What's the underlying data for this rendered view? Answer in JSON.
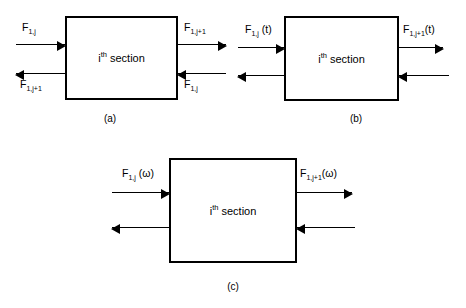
{
  "figure": {
    "type": "block-diagram",
    "panels": [
      {
        "id": "a",
        "caption": "(a)",
        "block_label_base": "i",
        "block_label_sup": "th",
        "block_label_rest": "section",
        "arrows": [
          {
            "id": "a-top-left",
            "direction": "right",
            "label_base": "F",
            "label_sub": "1,j",
            "label_suffix": ""
          },
          {
            "id": "a-top-right",
            "direction": "right",
            "label_base": "F",
            "label_sub": "1,j+1",
            "label_suffix": ""
          },
          {
            "id": "a-bottom-left",
            "direction": "left",
            "label_base": "F",
            "label_sub": "1,j+1",
            "label_suffix": ""
          },
          {
            "id": "a-bottom-right",
            "direction": "left",
            "label_base": "F",
            "label_sub": "1,j",
            "label_suffix": ""
          }
        ]
      },
      {
        "id": "b",
        "caption": "(b)",
        "block_label_base": "i",
        "block_label_sup": "th",
        "block_label_rest": "section",
        "arrows": [
          {
            "id": "b-top-left",
            "direction": "right",
            "label_base": "F",
            "label_sub": "1,j",
            "label_suffix": " (t)"
          },
          {
            "id": "b-top-right",
            "direction": "right",
            "label_base": "F",
            "label_sub": "1,j+1",
            "label_suffix": "(t)"
          },
          {
            "id": "b-bottom-left",
            "direction": "left",
            "label_base": "",
            "label_sub": "",
            "label_suffix": ""
          },
          {
            "id": "b-bottom-right",
            "direction": "left",
            "label_base": "",
            "label_sub": "",
            "label_suffix": ""
          }
        ]
      },
      {
        "id": "c",
        "caption": "(c)",
        "block_label_base": "i",
        "block_label_sup": "th",
        "block_label_rest": "section",
        "arrows": [
          {
            "id": "c-top-left",
            "direction": "right",
            "label_base": "F",
            "label_sub": "1,j",
            "label_suffix": " (ω)"
          },
          {
            "id": "c-top-right",
            "direction": "right",
            "label_base": "F",
            "label_sub": "1,j+1",
            "label_suffix": "(ω)"
          },
          {
            "id": "c-bottom-left",
            "direction": "left",
            "label_base": "",
            "label_sub": "",
            "label_suffix": ""
          },
          {
            "id": "c-bottom-right",
            "direction": "left",
            "label_base": "",
            "label_sub": "",
            "label_suffix": ""
          }
        ]
      }
    ],
    "colors": {
      "stroke": "#000000",
      "background": "#ffffff"
    }
  }
}
